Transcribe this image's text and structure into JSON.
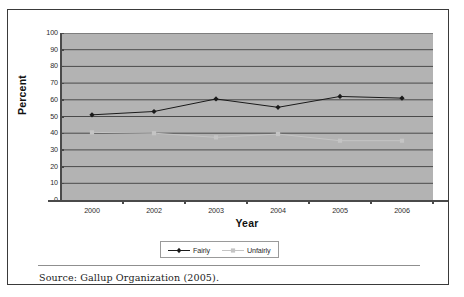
{
  "figure": {
    "source_note": "Source: Gallup Organization (2005).",
    "panel_color": "#b3b3b3",
    "frame_color": "#3a3a3a"
  },
  "chart_data": {
    "type": "line",
    "title": "",
    "xlabel": "Year",
    "ylabel": "Percent",
    "categories": [
      "2000",
      "2002",
      "2003",
      "2004",
      "2005",
      "2006"
    ],
    "ylim": [
      0,
      100
    ],
    "yticks": [
      "0",
      "10",
      "20",
      "30",
      "40",
      "50",
      "60",
      "70",
      "80",
      "90",
      "100"
    ],
    "ytick_values": [
      0,
      10,
      20,
      30,
      40,
      50,
      60,
      70,
      80,
      90,
      100
    ],
    "grid": "horizontal",
    "legend_position": "bottom",
    "series": [
      {
        "name": "Fairly",
        "color": "#1a1a1a",
        "marker": "diamond",
        "values": [
          51,
          53,
          60.5,
          55.5,
          62,
          61
        ]
      },
      {
        "name": "Unfairly",
        "color": "#c4c4c4",
        "marker": "square",
        "values": [
          40.5,
          40,
          37.5,
          39.5,
          35.5,
          35.5
        ]
      }
    ]
  }
}
